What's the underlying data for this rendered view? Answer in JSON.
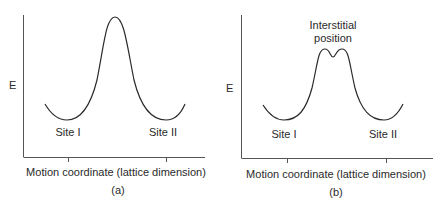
{
  "panels": [
    {
      "id": "a",
      "caption": "(a)",
      "y_label": "E",
      "x_label": "Motion coordinate (lattice dimension)",
      "site_labels": [
        "Site I",
        "Site II"
      ],
      "barrier": "single peak"
    },
    {
      "id": "b",
      "caption": "(b)",
      "y_label": "E",
      "x_label": "Motion coordinate (lattice dimension)",
      "site_labels": [
        "Site I",
        "Site II"
      ],
      "annotation_line1": "Interstitial",
      "annotation_line2": "position",
      "barrier": "double peak with metastable interstitial minimum"
    }
  ],
  "colors": {
    "line": "#2a2a2a",
    "axis": "#555555",
    "background": "#ffffff"
  }
}
